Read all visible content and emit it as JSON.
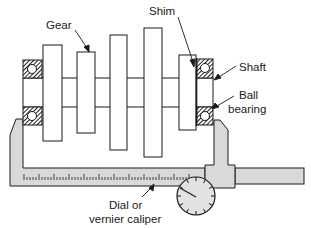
{
  "diagram": {
    "labels": {
      "gear": "Gear",
      "shim": "Shim",
      "shaft": "Shaft",
      "ball_bearing_line1": "Ball",
      "ball_bearing_line2": "bearing",
      "caliper_line1": "Dial or",
      "caliper_line2": "vernier caliper"
    },
    "components": [
      "gear",
      "shim",
      "shaft",
      "ball-bearing",
      "dial-or-vernier-caliper"
    ],
    "colors": {
      "line": "#1a1a1a",
      "caliper_fill": "#d9d9d9",
      "bearing_hatch": "#2a2a2a",
      "background": "#ffffff"
    }
  }
}
